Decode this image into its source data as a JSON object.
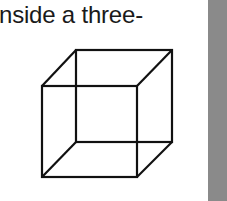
{
  "text": {
    "line": "nside a three-"
  },
  "figure": {
    "name": "necker-cube",
    "stroke_color": "#111111",
    "sidebar_color": "#8a8a8a"
  }
}
